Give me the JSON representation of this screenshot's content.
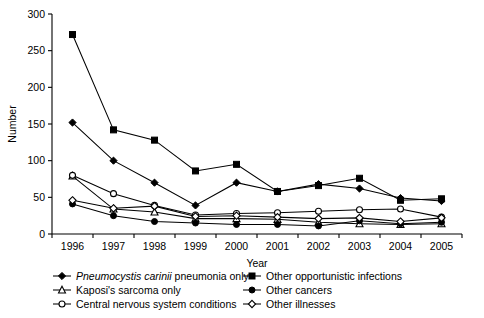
{
  "chart_data": {
    "type": "line",
    "title": "",
    "xlabel": "Year",
    "ylabel": "Number",
    "categories": [
      "1996",
      "1997",
      "1998",
      "1999",
      "2000",
      "2001",
      "2002",
      "2003",
      "2004",
      "2005"
    ],
    "x": [
      1996,
      1997,
      1998,
      1999,
      2000,
      2001,
      2002,
      2003,
      2004,
      2005
    ],
    "ylim": [
      0,
      300
    ],
    "yticks": [
      0,
      50,
      100,
      150,
      200,
      250,
      300
    ],
    "ytick_labels": [
      "0",
      "50",
      "100",
      "150",
      "200",
      "250",
      "300"
    ],
    "xtick_labels": [
      "1996",
      "1997",
      "1998",
      "1999",
      "2000",
      "2001",
      "2002",
      "2003",
      "2004",
      "2005"
    ],
    "grid": false,
    "legend_position": "below",
    "series": [
      {
        "name": "Pneumocystis carinii pneumonia only",
        "marker": "filled-diamond",
        "values": [
          152,
          100,
          70,
          39,
          70,
          58,
          68,
          62,
          49,
          45
        ]
      },
      {
        "name": "Other opportunistic infections",
        "marker": "filled-square",
        "values": [
          272,
          142,
          128,
          86,
          95,
          58,
          66,
          76,
          46,
          48
        ]
      },
      {
        "name": "Kaposi's sarcoma only",
        "marker": "open-triangle",
        "values": [
          79,
          34,
          30,
          21,
          21,
          20,
          16,
          14,
          13,
          14
        ]
      },
      {
        "name": "Other cancers",
        "marker": "filled-circle",
        "values": [
          41,
          25,
          17,
          15,
          13,
          13,
          11,
          18,
          14,
          16
        ]
      },
      {
        "name": "Central nervous system conditions",
        "marker": "open-circle",
        "values": [
          80,
          55,
          39,
          26,
          28,
          29,
          31,
          33,
          34,
          23
        ]
      },
      {
        "name": "Other illnesses",
        "marker": "open-diamond",
        "values": [
          46,
          35,
          38,
          24,
          25,
          23,
          21,
          22,
          17,
          22
        ]
      }
    ]
  },
  "legend": {
    "items": [
      {
        "label_italic": "Pneumocystis carinii",
        "label_rest": " pneumonia only",
        "marker": "filled-diamond"
      },
      {
        "label_italic": "",
        "label_rest": "Kaposi's sarcoma only",
        "marker": "open-triangle"
      },
      {
        "label_italic": "",
        "label_rest": "Central nervous system conditions",
        "marker": "open-circle"
      },
      {
        "label_italic": "",
        "label_rest": "Other opportunistic infections",
        "marker": "filled-square"
      },
      {
        "label_italic": "",
        "label_rest": "Other cancers",
        "marker": "filled-circle"
      },
      {
        "label_italic": "",
        "label_rest": "Other illnesses",
        "marker": "open-diamond"
      }
    ]
  }
}
